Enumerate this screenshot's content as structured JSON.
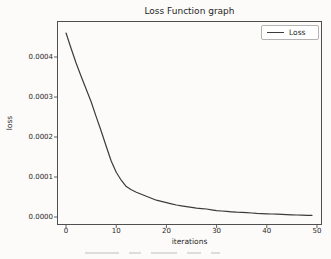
{
  "figure": {
    "title": "Loss Function graph",
    "xlabel": "iterations",
    "ylabel": "loss",
    "legend_label": "Loss"
  },
  "chart_data": {
    "type": "line",
    "title": "Loss Function graph",
    "xlabel": "iterations",
    "ylabel": "loss",
    "legend": [
      "Loss"
    ],
    "legend_position": "upper right",
    "grid": false,
    "xlim": [
      -1.8,
      51
    ],
    "ylim": [
      -2e-05,
      0.00049
    ],
    "xticks": [
      0,
      10,
      20,
      30,
      40,
      50
    ],
    "xtick_labels": [
      "0",
      "10",
      "20",
      "30",
      "40",
      "50"
    ],
    "yticks": [
      0,
      0.0001,
      0.0002,
      0.0003,
      0.0004
    ],
    "ytick_labels": [
      "0.0000",
      "0.0001",
      "0.0002",
      "0.0003",
      "0.0004"
    ],
    "line_color": "#3b3b3b",
    "axis_color": "#4f4f4f",
    "series": [
      {
        "name": "Loss",
        "x": [
          0,
          1,
          2,
          3,
          4,
          5,
          6,
          7,
          8,
          9,
          10,
          11,
          12,
          13,
          14,
          15,
          16,
          17,
          18,
          19,
          20,
          21,
          22,
          23,
          24,
          25,
          26,
          27,
          28,
          29,
          30,
          31,
          32,
          33,
          34,
          35,
          36,
          37,
          38,
          39,
          40,
          41,
          42,
          43,
          44,
          45,
          46,
          47,
          48,
          49
        ],
        "y": [
          0.00046,
          0.000422,
          0.000385,
          0.000352,
          0.00032,
          0.000288,
          0.000251,
          0.000215,
          0.000177,
          0.00014,
          0.000112,
          9.2e-05,
          7.6e-05,
          6.8e-05,
          6.2e-05,
          5.7e-05,
          5.2e-05,
          4.7e-05,
          4.2e-05,
          3.9e-05,
          3.6e-05,
          3.3e-05,
          3e-05,
          2.8e-05,
          2.6e-05,
          2.4e-05,
          2.2e-05,
          2.1e-05,
          2e-05,
          1.8e-05,
          1.6e-05,
          1.5e-05,
          1.4e-05,
          1.3e-05,
          1.2e-05,
          1.15e-05,
          1.1e-05,
          1e-05,
          9e-06,
          8.5e-06,
          8e-06,
          7.5e-06,
          7e-06,
          6.5e-06,
          6e-06,
          5.5e-06,
          5e-06,
          4.7e-06,
          4.3e-06,
          4e-06
        ]
      }
    ]
  },
  "colors": {
    "background": "#fcfbfa",
    "text": "#262626",
    "line": "#3b3b3b",
    "axis": "#4f4f4f",
    "legend_border": "#b3b3b3"
  }
}
